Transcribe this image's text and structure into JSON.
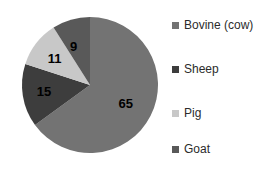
{
  "chart_data": {
    "type": "pie",
    "title": "",
    "subtitle": "",
    "xlabel": "",
    "ylabel": "",
    "grid": false,
    "legend_position": "right",
    "start_angle_deg": 0,
    "direction": "clockwise",
    "categories": [
      "Bovine (cow)",
      "Sheep",
      "Pig",
      "Goat"
    ],
    "values": [
      65,
      15,
      11,
      9
    ],
    "data_labels": [
      "65",
      "15",
      "11",
      "9"
    ],
    "colors": [
      "#737373",
      "#3d3d3d",
      "#c8c8c8",
      "#595959"
    ],
    "slices": [
      {
        "label": "Bovine (cow)",
        "value": 65,
        "data_label": "65",
        "color": "#737373"
      },
      {
        "label": "Sheep",
        "value": 15,
        "data_label": "15",
        "color": "#3d3d3d"
      },
      {
        "label": "Pig",
        "value": 11,
        "data_label": "11",
        "color": "#c8c8c8"
      },
      {
        "label": "Goat",
        "value": 9,
        "data_label": "9",
        "color": "#595959"
      }
    ]
  },
  "legend": {
    "items": [
      {
        "label": "Bovine (cow)",
        "color": "#737373"
      },
      {
        "label": "Sheep",
        "color": "#3d3d3d"
      },
      {
        "label": "Pig",
        "color": "#c8c8c8"
      },
      {
        "label": "Goat",
        "color": "#595959"
      }
    ]
  },
  "labels": {
    "bovine": "65",
    "sheep": "15",
    "pig": "11",
    "goat": "9"
  }
}
